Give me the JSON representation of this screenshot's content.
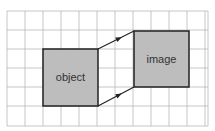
{
  "diagram": {
    "type": "grid-transformation",
    "grid": {
      "x0": 7,
      "y0": 11,
      "x1": 208,
      "y1": 126,
      "cols": [
        7,
        25,
        43,
        61,
        79,
        97,
        115,
        133,
        151,
        169,
        187,
        205
      ],
      "rows": [
        11,
        30,
        49,
        68,
        87,
        106,
        126
      ]
    },
    "colors": {
      "grid": "#b8b8b8",
      "box_fill": "#bdbdbd",
      "box_stroke": "#222222",
      "arrow": "#222222",
      "background": "#ffffff"
    },
    "boxes": [
      {
        "id": "object",
        "label": "object",
        "x": 43,
        "y": 49,
        "w": 55,
        "h": 57
      },
      {
        "id": "image",
        "label": "image",
        "x": 134,
        "y": 31,
        "w": 55,
        "h": 56
      }
    ],
    "arrows": [
      {
        "from": [
          98,
          49
        ],
        "to": [
          134,
          31
        ],
        "label": ""
      },
      {
        "from": [
          98,
          106
        ],
        "to": [
          134,
          87
        ],
        "label": ""
      }
    ]
  }
}
